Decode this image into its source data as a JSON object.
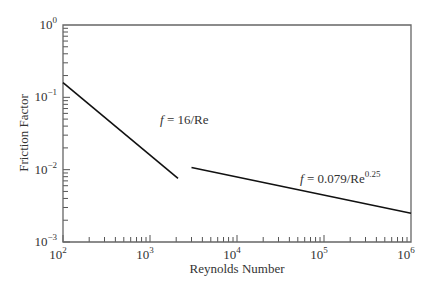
{
  "chart_data": {
    "type": "line",
    "title": "",
    "xlabel": "Reynolds Number",
    "ylabel": "Friction Factor",
    "xscale": "log",
    "yscale": "log",
    "xlim": [
      100,
      1000000
    ],
    "ylim": [
      0.001,
      1
    ],
    "grid": false,
    "x_ticks": [
      {
        "base": "10",
        "exp": "2",
        "value": 100
      },
      {
        "base": "10",
        "exp": "3",
        "value": 1000
      },
      {
        "base": "10",
        "exp": "4",
        "value": 10000
      },
      {
        "base": "10",
        "exp": "5",
        "value": 100000
      },
      {
        "base": "10",
        "exp": "6",
        "value": 1000000
      }
    ],
    "y_ticks": [
      {
        "base": "10",
        "exp": "0",
        "value": 1
      },
      {
        "base": "10",
        "exp": "−1",
        "value": 0.1
      },
      {
        "base": "10",
        "exp": "−2",
        "value": 0.01
      },
      {
        "base": "10",
        "exp": "−3",
        "value": 0.001
      }
    ],
    "series": [
      {
        "name": "laminar",
        "label_italic": "f",
        "label_rest": " = 16/Re",
        "x": [
          100,
          2100
        ],
        "y": [
          0.16,
          0.0076
        ]
      },
      {
        "name": "turbulent",
        "label_italic": "f",
        "label_rest": " = 0.079/Re",
        "label_sup": "0.25",
        "x": [
          3000,
          1000000
        ],
        "y": [
          0.0107,
          0.0025
        ]
      }
    ]
  }
}
